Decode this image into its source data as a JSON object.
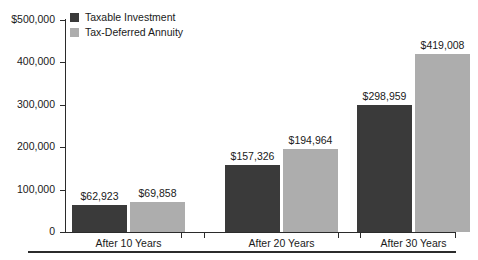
{
  "chart_data": {
    "type": "bar",
    "title": "",
    "subtitle": "",
    "xlabel": "",
    "ylabel": "",
    "categories": [
      "After 10 Years",
      "After 20 Years",
      "After 30 Years"
    ],
    "series": [
      {
        "name": "Taxable Investment",
        "color": "#3a3a3a",
        "values": [
          62923,
          157326,
          298959
        ],
        "labels": [
          "$62,923",
          "$157,326",
          "$298,959"
        ]
      },
      {
        "name": "Tax-Deferred Annuity",
        "color": "#adadad",
        "values": [
          69858,
          194964,
          419008
        ],
        "labels": [
          "$69,858",
          "$194,964",
          "$419,008"
        ]
      }
    ],
    "ylim": [
      0,
      500000
    ],
    "ytick_values": [
      0,
      100000,
      200000,
      300000,
      400000,
      500000
    ],
    "ytick_labels": [
      "0",
      "100,000",
      "200,000",
      "300,000",
      "400,000",
      "$500,000"
    ],
    "grid": false,
    "legend_position": "top-left"
  },
  "legend": {
    "items": [
      {
        "label": "Taxable Investment"
      },
      {
        "label": "Tax-Deferred Annuity"
      }
    ]
  },
  "axis": {
    "y_labels": [
      "$500,000",
      "400,000",
      "300,000",
      "200,000",
      "100,000",
      "0"
    ],
    "x_labels": [
      "After 10 Years",
      "After 20 Years",
      "After 30 Years"
    ]
  },
  "colors": {
    "series_dark": "#3a3a3a",
    "series_light": "#adadad",
    "axis": "#2b2b2b",
    "background": "#ffffff"
  }
}
